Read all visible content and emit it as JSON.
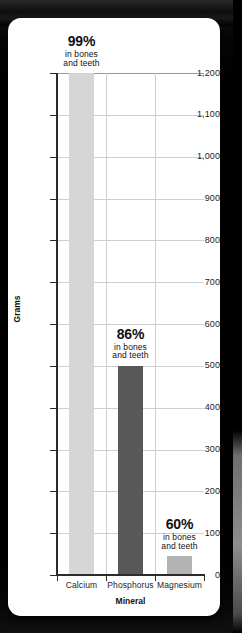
{
  "chart_data": {
    "type": "bar",
    "title": "",
    "xlabel": "Mineral",
    "ylabel": "Grams",
    "categories": [
      "Calcium",
      "Phosphorus",
      "Magnesium"
    ],
    "values": [
      1200,
      500,
      45
    ],
    "ylim": [
      0,
      1200
    ],
    "y_ticks": [
      0,
      100,
      200,
      300,
      400,
      500,
      600,
      700,
      800,
      900,
      1000,
      1100,
      1200
    ],
    "y_tick_labels": [
      "0",
      "100",
      "200",
      "300",
      "400",
      "500",
      "600",
      "700",
      "800",
      "900",
      "1,000",
      "1,100",
      "1,200"
    ],
    "grid": "horizontal-and-vertical",
    "legend": "none",
    "bar_colors": [
      "#d6d6d6",
      "#585858",
      "#b3b3b3"
    ],
    "annotations": [
      {
        "category": "Calcium",
        "percent": "99%",
        "line1": "in bones",
        "line2": "and teeth"
      },
      {
        "category": "Phosphorus",
        "percent": "86%",
        "line1": "in bones",
        "line2": "and teeth"
      },
      {
        "category": "Magnesium",
        "percent": "60%",
        "line1": "in bones",
        "line2": "and teeth"
      }
    ]
  },
  "colors": {
    "background": "#000000",
    "card": "#ffffff",
    "axis": "#2b2b2b",
    "gridline": "#cfcfcf",
    "text": "#111111"
  }
}
